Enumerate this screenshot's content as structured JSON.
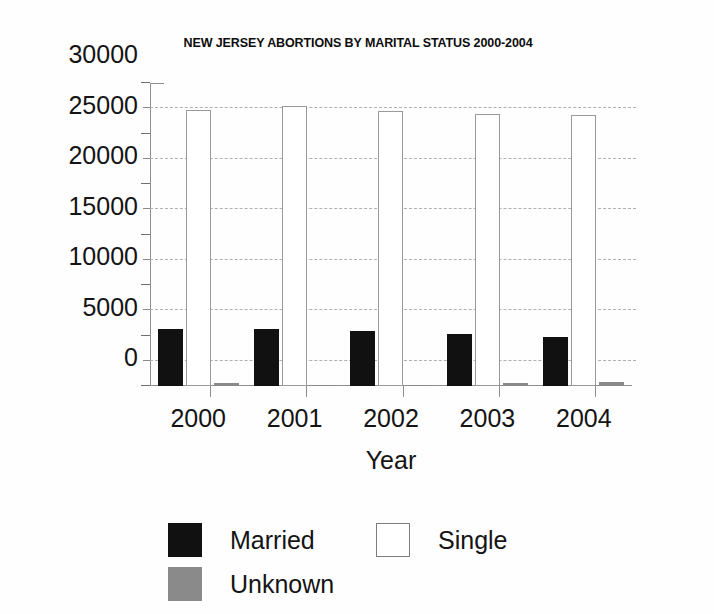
{
  "chart_data": {
    "type": "bar",
    "title": "NEW JERSEY ABORTIONS BY MARITAL STATUS 2000-2004",
    "xlabel": "Year",
    "ylabel": "",
    "categories": [
      "2000",
      "2001",
      "2002",
      "2003",
      "2004"
    ],
    "series": [
      {
        "name": "Married",
        "color": "#111111",
        "values": [
          5600,
          5650,
          5450,
          5150,
          4850
        ]
      },
      {
        "name": "Single",
        "color": "#ffffff",
        "values": [
          27300,
          27700,
          27200,
          26900,
          26850
        ]
      },
      {
        "name": "Unknown",
        "color": "#8a8a8a",
        "values": [
          280,
          110,
          130,
          320,
          430
        ]
      }
    ],
    "ylim": [
      0,
      30000
    ],
    "ytick_values": [
      0,
      5000,
      10000,
      15000,
      20000,
      25000,
      30000
    ],
    "ytick_labels": [
      "0",
      "5000",
      "10000",
      "15000",
      "20000",
      "25000",
      "30000"
    ],
    "minor_tick_values": [
      2500,
      7500,
      12500,
      17500,
      22500,
      27500
    ],
    "gridline_values": [
      2500,
      7500,
      12500,
      17500,
      22500,
      27500
    ],
    "grid": true,
    "grid_style": "dashed",
    "legend_position": "bottom",
    "legend_entries": [
      "Married",
      "Single",
      "Unknown"
    ]
  },
  "legend": {
    "married_label": "Married",
    "single_label": "Single",
    "unknown_label": "Unknown"
  }
}
